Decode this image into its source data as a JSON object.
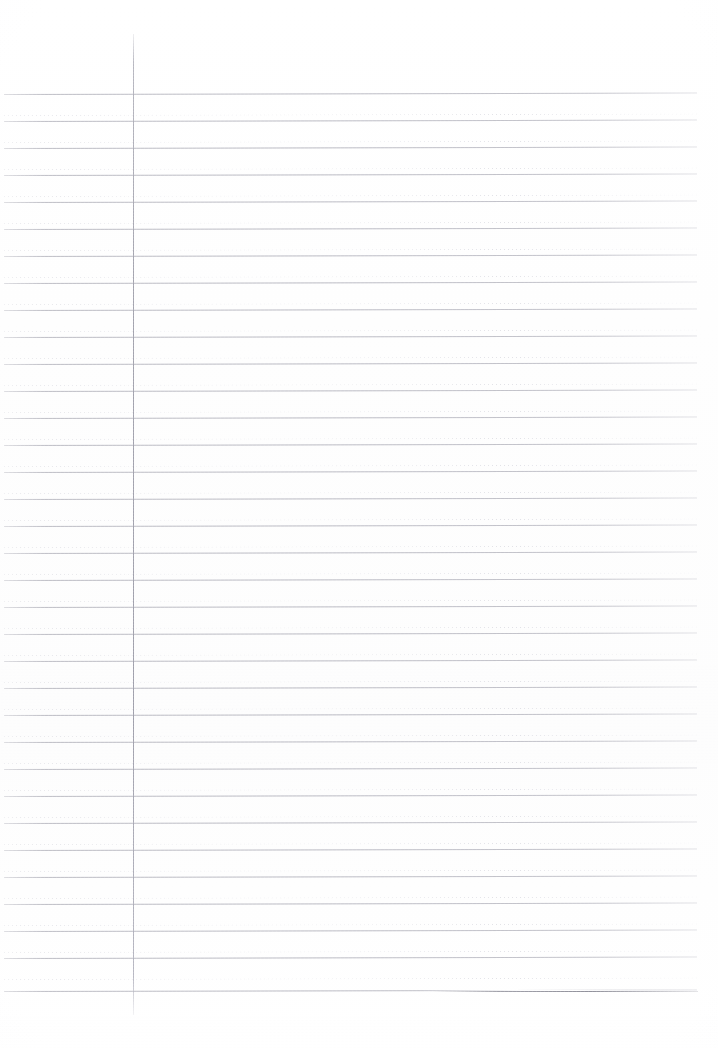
{
  "document": {
    "kind": "scanned-lined-notebook-paper",
    "page_width": 718,
    "page_height": 1048,
    "background_color": "#ffffff",
    "written_content": "",
    "visible_text": ""
  },
  "paper": {
    "rule_color": "#b5b5be",
    "dotted_rule_color": "#c6c6d0",
    "margin_line_color": "#a4a4af",
    "rule_left_x": 4,
    "rule_right_x": 697,
    "rule_span_width": 693,
    "line_spacing_px": 27,
    "solid_rule_count": 34,
    "dotted_rule_count": 34,
    "first_solid_rule_y": 94,
    "last_solid_rule_y": 991,
    "rule_tilt_deg": -0.12
  },
  "margin_line": {
    "x": 133,
    "top_y": 34,
    "bottom_y": 1015,
    "width_px": 1
  },
  "artifact": {
    "label": "scan-fold-highlight",
    "x": 418,
    "y": 990,
    "width": 290,
    "darken_x": 432,
    "darken_y": 991,
    "darken_width": 266
  },
  "solid_rules": [
    {
      "y": 94
    },
    {
      "y": 121
    },
    {
      "y": 148
    },
    {
      "y": 175
    },
    {
      "y": 202
    },
    {
      "y": 229
    },
    {
      "y": 256
    },
    {
      "y": 283
    },
    {
      "y": 310
    },
    {
      "y": 337
    },
    {
      "y": 364
    },
    {
      "y": 391
    },
    {
      "y": 418
    },
    {
      "y": 445
    },
    {
      "y": 472
    },
    {
      "y": 499
    },
    {
      "y": 526
    },
    {
      "y": 553
    },
    {
      "y": 580
    },
    {
      "y": 607
    },
    {
      "y": 634
    },
    {
      "y": 661
    },
    {
      "y": 688
    },
    {
      "y": 715
    },
    {
      "y": 742
    },
    {
      "y": 769
    },
    {
      "y": 796
    },
    {
      "y": 823
    },
    {
      "y": 850
    },
    {
      "y": 877
    },
    {
      "y": 904
    },
    {
      "y": 931
    },
    {
      "y": 958
    },
    {
      "y": 991
    }
  ],
  "dotted_rules": [
    {
      "y": 115
    },
    {
      "y": 142
    },
    {
      "y": 169
    },
    {
      "y": 196
    },
    {
      "y": 223
    },
    {
      "y": 250
    },
    {
      "y": 277
    },
    {
      "y": 304
    },
    {
      "y": 331
    },
    {
      "y": 358
    },
    {
      "y": 385
    },
    {
      "y": 412
    },
    {
      "y": 439
    },
    {
      "y": 466
    },
    {
      "y": 493
    },
    {
      "y": 520
    },
    {
      "y": 547
    },
    {
      "y": 574
    },
    {
      "y": 601
    },
    {
      "y": 628
    },
    {
      "y": 655
    },
    {
      "y": 682
    },
    {
      "y": 709
    },
    {
      "y": 736
    },
    {
      "y": 763
    },
    {
      "y": 790
    },
    {
      "y": 817
    },
    {
      "y": 844
    },
    {
      "y": 871
    },
    {
      "y": 898
    },
    {
      "y": 925
    },
    {
      "y": 952
    },
    {
      "y": 979
    }
  ]
}
